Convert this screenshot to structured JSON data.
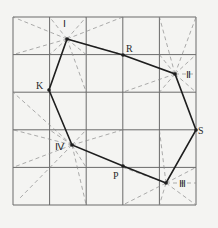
{
  "diagram": {
    "type": "grid-polygon",
    "grid": {
      "cols": 5,
      "rows": 5,
      "x_lines": [
        13,
        49.6,
        86.2,
        122.8,
        159.4,
        196
      ],
      "y_lines": [
        17,
        54.6,
        92.2,
        129.8,
        167.4,
        205
      ]
    },
    "points": [
      {
        "id": "I",
        "label": "Ⅰ",
        "x": 67,
        "y": 39,
        "lx": 63,
        "ly": 19
      },
      {
        "id": "R",
        "label": "R",
        "x": 123,
        "y": 55,
        "lx": 126,
        "ly": 44
      },
      {
        "id": "II",
        "label": "Ⅱ",
        "x": 175,
        "y": 74,
        "lx": 186,
        "ly": 70
      },
      {
        "id": "S",
        "label": "S",
        "x": 196,
        "y": 130,
        "lx": 198,
        "ly": 126
      },
      {
        "id": "III",
        "label": "Ⅲ",
        "x": 166,
        "y": 183,
        "lx": 179,
        "ly": 179
      },
      {
        "id": "P",
        "label": "P",
        "x": 123,
        "y": 166,
        "lx": 113,
        "ly": 171
      },
      {
        "id": "IV",
        "label": "Ⅳ",
        "x": 72,
        "y": 145,
        "lx": 55,
        "ly": 142
      },
      {
        "id": "K",
        "label": "K",
        "x": 49,
        "y": 90,
        "lx": 36,
        "ly": 81
      }
    ],
    "polygon_order": [
      "I",
      "R",
      "II",
      "S",
      "III",
      "P",
      "IV",
      "K"
    ],
    "rays": {
      "I": [
        [
          13,
          17
        ],
        [
          13,
          54.6
        ],
        [
          49.6,
          17
        ],
        [
          86.2,
          17
        ],
        [
          122.8,
          17
        ],
        [
          122.8,
          54.6
        ],
        [
          86.2,
          54.6
        ],
        [
          86.2,
          92.2
        ],
        [
          49.6,
          54.6
        ]
      ],
      "II": [
        [
          159.4,
          17
        ],
        [
          196,
          17
        ],
        [
          159.4,
          54.6
        ],
        [
          196,
          54.6
        ],
        [
          159.4,
          92.2
        ],
        [
          196,
          92.2
        ],
        [
          122.8,
          92.2
        ],
        [
          196,
          74
        ]
      ],
      "IV": [
        [
          13,
          92.2
        ],
        [
          13,
          129.8
        ],
        [
          13,
          167.4
        ],
        [
          20,
          198
        ],
        [
          86.2,
          205
        ],
        [
          86.2,
          167.4
        ],
        [
          122.8,
          129.8
        ],
        [
          86.2,
          129.8
        ],
        [
          49.6,
          129.8
        ]
      ],
      "III": [
        [
          159.4,
          129.8
        ],
        [
          122.8,
          205
        ],
        [
          159.4,
          205
        ],
        [
          196,
          205
        ],
        [
          196,
          167.4
        ],
        [
          122.8,
          167.4
        ],
        [
          196,
          183
        ]
      ]
    },
    "colors": {
      "background": "#f4f4f2",
      "grid": "#6a6a6a",
      "dashed": "#8a8a8a",
      "polygon": "#1e1e1e"
    }
  }
}
